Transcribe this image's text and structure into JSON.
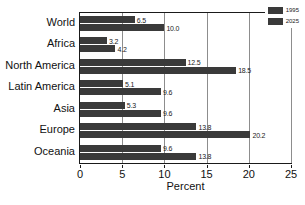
{
  "chart_data": {
    "type": "bar",
    "orientation": "horizontal",
    "title": "",
    "subtitle": "",
    "xlabel": "Percent",
    "ylabel": "",
    "xlim": [
      0,
      25
    ],
    "xticks": [
      0,
      5,
      10,
      15,
      20,
      25
    ],
    "xtick_labels": [
      "0",
      "5",
      "10",
      "15",
      "20",
      "25"
    ],
    "grid": true,
    "grid_axis": "x",
    "legend_position": "top-right",
    "categories": [
      "World",
      "Africa",
      "North America",
      "Latin America",
      "Asia",
      "Europe",
      "Oceania"
    ],
    "series": [
      {
        "name": "1995",
        "color": "#3a3a3a",
        "values": [
          6.5,
          3.2,
          12.5,
          5.1,
          5.3,
          13.8,
          9.6
        ],
        "value_labels": [
          "6.5",
          "3.2",
          "12.5",
          "5.1",
          "5.3",
          "13.8",
          "9.6"
        ]
      },
      {
        "name": "2025",
        "color": "#3a3a3a",
        "values": [
          10.0,
          4.2,
          18.5,
          9.6,
          9.6,
          20.2,
          13.8
        ],
        "value_labels": [
          "10.0",
          "4.2",
          "18.5",
          "9.6",
          "9.6",
          "20.2",
          "13.8"
        ]
      }
    ]
  },
  "legend": {
    "entries": [
      {
        "label": "1995"
      },
      {
        "label": "2025"
      }
    ]
  },
  "footer": {
    "smudge_text": ""
  }
}
